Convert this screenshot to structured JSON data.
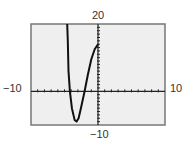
{
  "chart_data": {
    "type": "line",
    "title": "",
    "xlabel": "",
    "ylabel": "",
    "xlim": [
      -10,
      10
    ],
    "ylim": [
      -10,
      20
    ],
    "window_labels": {
      "ymax": "20",
      "ymin": "−10",
      "xmin": "−10",
      "xmax": "10"
    },
    "x_tick_step": 1,
    "y_tick_step": 1,
    "grid": false,
    "series": [
      {
        "name": "f(x)",
        "x": [
          -4.6,
          -4.5,
          -4.4,
          -4.2,
          -3.9,
          -3.5,
          -3.2,
          -2.9,
          -2.5,
          -2.0,
          -1.5,
          -1.0,
          -0.5,
          0.0
        ],
        "y": [
          20,
          15,
          6,
          0,
          -5,
          -8.5,
          -9.0,
          -8.0,
          -4.5,
          0,
          5,
          9.5,
          12.5,
          14
        ]
      }
    ]
  },
  "colors": {
    "background": "#ffffff",
    "plot_bg": "#efefef",
    "frame": "#777777",
    "axis": "#222222",
    "curve": "#111111"
  }
}
